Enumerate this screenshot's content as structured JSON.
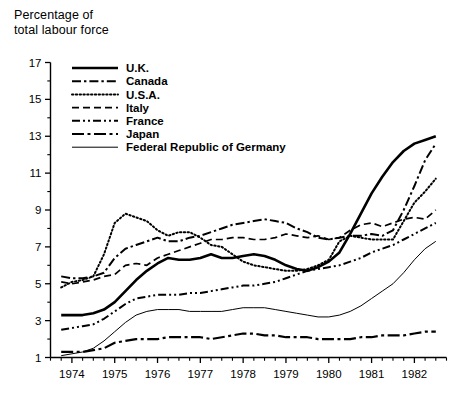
{
  "axis_title": {
    "line1": "Percentage of",
    "line2": "total labour force"
  },
  "chart_data": {
    "type": "line",
    "title": "",
    "subtitle": "",
    "xlabel": "",
    "ylabel": "Percentage of total labour force",
    "xlim": [
      1973.5,
      1982.75
    ],
    "ylim": [
      1,
      17
    ],
    "yticks": [
      1,
      3,
      5,
      7,
      9,
      11,
      13,
      15,
      17
    ],
    "ytick_labels": [
      "1",
      "3",
      "5",
      "7",
      "9",
      "11",
      "13",
      "15",
      "17"
    ],
    "y_minor_step": 1,
    "xticks": [
      1974,
      1975,
      1976,
      1977,
      1978,
      1979,
      1980,
      1981,
      1982
    ],
    "xtick_labels": [
      "1974",
      "1975",
      "1976",
      "1977",
      "1978",
      "1979",
      "1980",
      "1981",
      "1982"
    ],
    "x_minor_step": 0.25,
    "grid": false,
    "legend_position": "top-left",
    "x_unit": "quarters",
    "series": [
      {
        "name": "U.K.",
        "style": "solid-thick",
        "color": "#000000",
        "x": [
          1973.75,
          1974.0,
          1974.25,
          1974.5,
          1974.75,
          1975.0,
          1975.25,
          1975.5,
          1975.75,
          1976.0,
          1976.25,
          1976.5,
          1976.75,
          1977.0,
          1977.25,
          1977.5,
          1977.75,
          1978.0,
          1978.25,
          1978.5,
          1978.75,
          1979.0,
          1979.25,
          1979.5,
          1979.75,
          1980.0,
          1980.25,
          1980.5,
          1980.75,
          1981.0,
          1981.25,
          1981.5,
          1981.75,
          1982.0,
          1982.25,
          1982.5
        ],
        "y": [
          3.3,
          3.3,
          3.3,
          3.4,
          3.6,
          4.0,
          4.6,
          5.2,
          5.7,
          6.1,
          6.4,
          6.3,
          6.3,
          6.4,
          6.6,
          6.4,
          6.4,
          6.5,
          6.6,
          6.5,
          6.3,
          6.0,
          5.8,
          5.7,
          5.9,
          6.2,
          6.7,
          7.7,
          8.8,
          9.9,
          10.8,
          11.6,
          12.2,
          12.6,
          12.8,
          13.0
        ]
      },
      {
        "name": "Canada",
        "style": "dash-dot",
        "color": "#000000",
        "x": [
          1973.75,
          1974.0,
          1974.25,
          1974.5,
          1974.75,
          1975.0,
          1975.25,
          1975.5,
          1975.75,
          1976.0,
          1976.25,
          1976.5,
          1976.75,
          1977.0,
          1977.25,
          1977.5,
          1977.75,
          1978.0,
          1978.25,
          1978.5,
          1978.75,
          1979.0,
          1979.25,
          1979.5,
          1979.75,
          1980.0,
          1980.25,
          1980.5,
          1980.75,
          1981.0,
          1981.25,
          1981.5,
          1981.75,
          1982.0,
          1982.25,
          1982.5
        ],
        "y": [
          5.4,
          5.3,
          5.3,
          5.4,
          5.6,
          6.4,
          6.9,
          7.1,
          7.3,
          7.5,
          7.3,
          7.3,
          7.5,
          7.6,
          7.8,
          8.0,
          8.2,
          8.3,
          8.4,
          8.5,
          8.4,
          8.3,
          8.0,
          7.8,
          7.5,
          7.4,
          7.5,
          7.6,
          7.6,
          7.7,
          7.6,
          7.9,
          9.0,
          10.3,
          11.7,
          12.6
        ]
      },
      {
        "name": "U.S.A.",
        "style": "dotted",
        "color": "#000000",
        "x": [
          1973.75,
          1974.0,
          1974.25,
          1974.5,
          1974.75,
          1975.0,
          1975.25,
          1975.5,
          1975.75,
          1976.0,
          1976.25,
          1976.5,
          1976.75,
          1977.0,
          1977.25,
          1977.5,
          1977.75,
          1978.0,
          1978.25,
          1978.5,
          1978.75,
          1979.0,
          1979.25,
          1979.5,
          1979.75,
          1980.0,
          1980.25,
          1980.5,
          1980.75,
          1981.0,
          1981.25,
          1981.5,
          1981.75,
          1982.0,
          1982.25,
          1982.5
        ],
        "y": [
          4.8,
          5.1,
          5.2,
          5.4,
          6.6,
          8.3,
          8.8,
          8.6,
          8.4,
          7.9,
          7.6,
          7.8,
          7.8,
          7.5,
          7.1,
          7.0,
          6.6,
          6.2,
          6.0,
          5.9,
          5.8,
          5.7,
          5.7,
          5.8,
          6.0,
          6.3,
          7.3,
          7.6,
          7.5,
          7.4,
          7.4,
          7.4,
          8.4,
          9.4,
          10.0,
          10.7
        ]
      },
      {
        "name": "Italy",
        "style": "dashed",
        "color": "#000000",
        "x": [
          1973.75,
          1974.0,
          1974.25,
          1974.5,
          1974.75,
          1975.0,
          1975.25,
          1975.5,
          1975.75,
          1976.0,
          1976.25,
          1976.5,
          1976.75,
          1977.0,
          1977.25,
          1977.5,
          1977.75,
          1978.0,
          1978.25,
          1978.5,
          1978.75,
          1979.0,
          1979.25,
          1979.5,
          1979.75,
          1980.0,
          1980.25,
          1980.5,
          1980.75,
          1981.0,
          1981.25,
          1981.5,
          1981.75,
          1982.0,
          1982.25,
          1982.5
        ],
        "y": [
          5.1,
          5.0,
          5.1,
          5.2,
          5.4,
          5.5,
          6.0,
          6.1,
          6.0,
          6.4,
          6.6,
          6.8,
          7.0,
          7.2,
          7.4,
          7.4,
          7.5,
          7.5,
          7.4,
          7.4,
          7.5,
          7.7,
          7.6,
          7.5,
          7.6,
          7.4,
          7.5,
          7.9,
          8.2,
          8.3,
          8.1,
          8.3,
          8.5,
          8.6,
          8.5,
          9.0
        ]
      },
      {
        "name": "France",
        "style": "dash-dot-dot",
        "color": "#000000",
        "x": [
          1973.75,
          1974.0,
          1974.25,
          1974.5,
          1974.75,
          1975.0,
          1975.25,
          1975.5,
          1975.75,
          1976.0,
          1976.25,
          1976.5,
          1976.75,
          1977.0,
          1977.25,
          1977.5,
          1977.75,
          1978.0,
          1978.25,
          1978.5,
          1978.75,
          1979.0,
          1979.25,
          1979.5,
          1979.75,
          1980.0,
          1980.25,
          1980.5,
          1980.75,
          1981.0,
          1981.25,
          1981.5,
          1981.75,
          1982.0,
          1982.25,
          1982.5
        ],
        "y": [
          2.5,
          2.6,
          2.7,
          2.8,
          3.1,
          3.5,
          3.9,
          4.2,
          4.3,
          4.4,
          4.4,
          4.4,
          4.5,
          4.5,
          4.6,
          4.7,
          4.8,
          4.9,
          4.9,
          5.0,
          5.1,
          5.3,
          5.5,
          5.7,
          5.8,
          5.9,
          6.0,
          6.2,
          6.4,
          6.7,
          6.9,
          7.1,
          7.4,
          7.7,
          8.0,
          8.3
        ]
      },
      {
        "name": "Japan",
        "style": "long-dash-dot",
        "color": "#000000",
        "x": [
          1973.75,
          1974.0,
          1974.25,
          1974.5,
          1974.75,
          1975.0,
          1975.25,
          1975.5,
          1975.75,
          1976.0,
          1976.25,
          1976.5,
          1976.75,
          1977.0,
          1977.25,
          1977.5,
          1977.75,
          1978.0,
          1978.25,
          1978.5,
          1978.75,
          1979.0,
          1979.25,
          1979.5,
          1979.75,
          1980.0,
          1980.25,
          1980.5,
          1980.75,
          1981.0,
          1981.25,
          1981.5,
          1981.75,
          1982.0,
          1982.25,
          1982.5
        ],
        "y": [
          1.3,
          1.3,
          1.3,
          1.4,
          1.5,
          1.8,
          1.9,
          2.0,
          2.0,
          2.0,
          2.1,
          2.1,
          2.1,
          2.1,
          2.0,
          2.1,
          2.2,
          2.3,
          2.3,
          2.2,
          2.2,
          2.1,
          2.1,
          2.1,
          2.0,
          2.0,
          2.0,
          2.0,
          2.1,
          2.1,
          2.2,
          2.2,
          2.2,
          2.3,
          2.4,
          2.4
        ]
      },
      {
        "name": "Federal Republic of Germany",
        "style": "solid-thin",
        "color": "#000000",
        "x": [
          1973.75,
          1974.0,
          1974.25,
          1974.5,
          1974.75,
          1975.0,
          1975.25,
          1975.5,
          1975.75,
          1976.0,
          1976.25,
          1976.5,
          1976.75,
          1977.0,
          1977.25,
          1977.5,
          1977.75,
          1978.0,
          1978.25,
          1978.5,
          1978.75,
          1979.0,
          1979.25,
          1979.5,
          1979.75,
          1980.0,
          1980.25,
          1980.5,
          1980.75,
          1981.0,
          1981.25,
          1981.5,
          1981.75,
          1982.0,
          1982.25,
          1982.5
        ],
        "y": [
          1.1,
          1.2,
          1.3,
          1.5,
          1.9,
          2.4,
          2.9,
          3.3,
          3.5,
          3.6,
          3.6,
          3.6,
          3.5,
          3.5,
          3.5,
          3.5,
          3.6,
          3.7,
          3.7,
          3.7,
          3.6,
          3.5,
          3.4,
          3.3,
          3.2,
          3.2,
          3.3,
          3.5,
          3.8,
          4.2,
          4.6,
          5.0,
          5.6,
          6.3,
          6.9,
          7.3
        ]
      }
    ]
  },
  "legend": {
    "items": [
      {
        "label": "U.K.",
        "style": "solid-thick"
      },
      {
        "label": "Canada",
        "style": "dash-dot"
      },
      {
        "label": "U.S.A.",
        "style": "dotted"
      },
      {
        "label": "Italy",
        "style": "dashed"
      },
      {
        "label": "France",
        "style": "dash-dot-dot"
      },
      {
        "label": "Japan",
        "style": "long-dash-dot"
      },
      {
        "label": "Federal Republic of Germany",
        "style": "solid-thin"
      }
    ]
  }
}
